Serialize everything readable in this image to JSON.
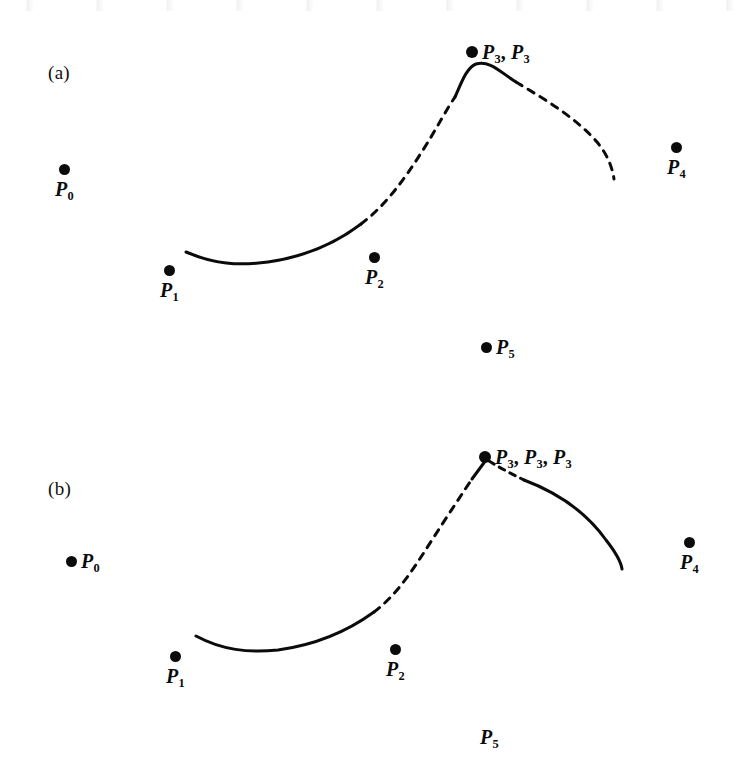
{
  "figure": {
    "background_color": "#ffffff",
    "ink_color": "#0b0b0b",
    "width": 737,
    "height": 776
  },
  "panels": [
    {
      "id": "a",
      "label": "(a)",
      "label_x": 48,
      "label_y": 62,
      "control_points": [
        {
          "name": "P0",
          "base": "P",
          "subscript": "0",
          "dot_x": 67,
          "dot_y": 170,
          "label_layout": "dot-above",
          "label_x": 55,
          "label_y": 182
        },
        {
          "name": "P1",
          "base": "P",
          "subscript": "1",
          "dot_x": 172,
          "dot_y": 271,
          "label_layout": "dot-above",
          "label_x": 160,
          "label_y": 283
        },
        {
          "name": "P2",
          "base": "P",
          "subscript": "2",
          "dot_x": 377,
          "dot_y": 258,
          "label_layout": "dot-above",
          "label_x": 365,
          "label_y": 270
        },
        {
          "name": "P3",
          "base": "P",
          "subscript": "3",
          "dot_x": 472,
          "dot_y": 52,
          "label_layout": "dot-left",
          "label_x": 466,
          "label_y": 44,
          "label_text_repeat": 2
        },
        {
          "name": "P4",
          "base": "P",
          "subscript": "4",
          "dot_x": 679,
          "dot_y": 148,
          "label_layout": "dot-above",
          "label_x": 667,
          "label_y": 160
        },
        {
          "name": "P5",
          "base": "P",
          "subscript": "5",
          "dot_x": 487,
          "dot_y": 343,
          "label_layout": "dot-left",
          "label_x": 481,
          "label_y": 335
        }
      ],
      "point_labels": [
        "P0",
        "P1",
        "P2",
        "P3, P3",
        "P4",
        "P5"
      ],
      "curve_segments": [
        {
          "style": "solid",
          "note": "lower-left flat segment rising toward P2"
        },
        {
          "style": "dashed",
          "note": "steep ascent from near P2 up to just before the peak"
        },
        {
          "style": "solid",
          "note": "short rounded peak through P3"
        },
        {
          "style": "dashed",
          "note": "long descent from peak down toward P4 region"
        }
      ]
    },
    {
      "id": "b",
      "label": "(b)",
      "label_x": 48,
      "label_y": 478,
      "control_points": [
        {
          "name": "P0",
          "base": "P",
          "subscript": "0",
          "dot_x": 72,
          "dot_y": 561,
          "label_layout": "dot-left",
          "label_x": 66,
          "label_y": 553
        },
        {
          "name": "P1",
          "base": "P",
          "subscript": "1",
          "dot_x": 178,
          "dot_y": 657,
          "label_layout": "dot-above",
          "label_x": 166,
          "label_y": 669
        },
        {
          "name": "P2",
          "base": "P",
          "subscript": "2",
          "dot_x": 398,
          "dot_y": 650,
          "label_layout": "dot-above",
          "label_x": 386,
          "label_y": 662
        },
        {
          "name": "P3",
          "base": "P",
          "subscript": "3",
          "dot_x": 487,
          "dot_y": 457,
          "label_layout": "dot-left",
          "label_x": 481,
          "label_y": 449,
          "label_text_repeat": 3
        },
        {
          "name": "P4",
          "base": "P",
          "subscript": "4",
          "dot_x": 692,
          "dot_y": 543,
          "label_layout": "dot-above",
          "label_x": 680,
          "label_y": 555
        },
        {
          "name": "P5",
          "base": "P",
          "subscript": "5",
          "dot_x": null,
          "dot_y": null,
          "label_layout": "label-only",
          "label_x": 480,
          "label_y": 735
        }
      ],
      "point_labels": [
        "P0",
        "P1",
        "P2",
        "P3, P3, P3",
        "P4",
        "P5"
      ],
      "curve_segments": [
        {
          "style": "solid",
          "note": "lower-left flat segment rising toward P2"
        },
        {
          "style": "dashed",
          "note": "steep ascent from near P2 up toward P3"
        },
        {
          "style": "solid",
          "note": "short straight run into the cusp at P3"
        },
        {
          "style": "dashed",
          "note": "short dash leaving the cusp to the right"
        },
        {
          "style": "solid",
          "note": "long solid descent curving down toward P4 region"
        }
      ]
    }
  ]
}
